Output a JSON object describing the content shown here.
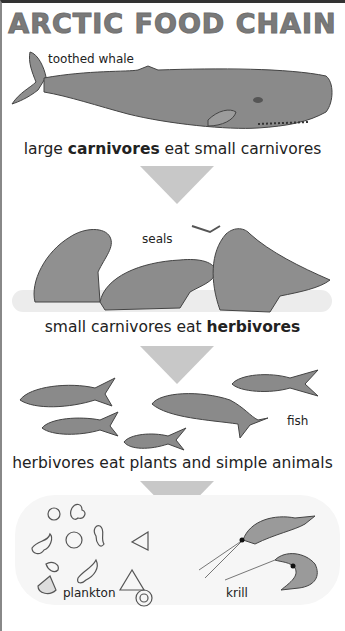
{
  "title": "ARCTIC FOOD CHAIN",
  "levels": [
    {
      "organism_label": "toothed whale",
      "caption_parts": {
        "pre": "large ",
        "bold": "carnivores",
        "post": " eat small carnivores"
      }
    },
    {
      "organism_label": "seals",
      "caption_parts": {
        "pre": "small carnivores eat ",
        "bold": "herbivores",
        "post": ""
      }
    },
    {
      "organism_label": "fish",
      "caption_parts": {
        "pre": "herbivores eat plants and simple animals",
        "bold": "",
        "post": ""
      }
    },
    {
      "organism_labels": [
        "plankton",
        "krill"
      ]
    }
  ],
  "colors": {
    "arrow": "#c8c8c8",
    "title": "#7a7a7a",
    "animal": "#8a8a8a"
  }
}
